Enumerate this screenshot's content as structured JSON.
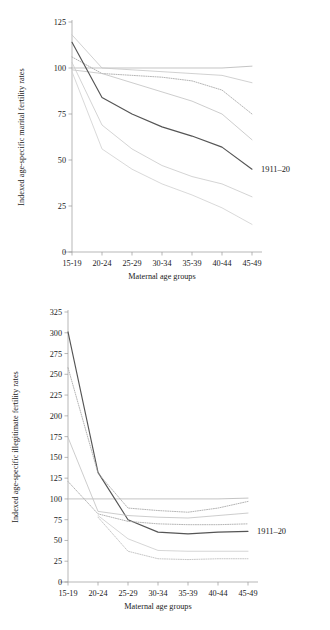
{
  "figure": {
    "charts": [
      {
        "name": "marital-fertility",
        "chart_data": {
          "type": "line",
          "title": "",
          "xlabel": "Maternal age groups",
          "ylabel": "Indexed age-specific marital fertility rates",
          "categories": [
            "15-19",
            "20-24",
            "25-29",
            "30-34",
            "35-39",
            "40-44",
            "45-49"
          ],
          "ylim": [
            0,
            125
          ],
          "yticks": [
            0,
            25,
            50,
            75,
            100,
            125
          ],
          "grid": false,
          "legend_position": "inline-right",
          "annotations": [
            {
              "text": "1911–20",
              "x": "45-49",
              "y": 45
            }
          ],
          "series": [
            {
              "name": "baseline-flat",
              "style": "solid",
              "color": "#b9b9b9",
              "values": [
                100,
                100,
                100,
                100,
                100,
                100,
                101
              ]
            },
            {
              "name": "cohort-a",
              "style": "solid",
              "color": "#c9c9c9",
              "values": [
                118,
                100,
                99,
                98,
                97,
                96,
                92
              ]
            },
            {
              "name": "cohort-b",
              "style": "dotted",
              "color": "#a8a8a8",
              "values": [
                106,
                97,
                96,
                95,
                93,
                88,
                75
              ]
            },
            {
              "name": "cohort-c",
              "style": "solid",
              "color": "#c4c4c4",
              "values": [
                99,
                97,
                92,
                87,
                82,
                75,
                61
              ]
            },
            {
              "name": "cohort-1911-20",
              "style": "solid",
              "color": "#555555",
              "values": [
                114,
                84,
                75,
                68,
                63,
                57,
                45
              ]
            },
            {
              "name": "cohort-d",
              "style": "solid",
              "color": "#cccccc",
              "values": [
                103,
                69,
                56,
                47,
                41,
                37,
                30
              ]
            },
            {
              "name": "cohort-e",
              "style": "solid",
              "color": "#d2d2d2",
              "values": [
                98,
                56,
                45,
                37,
                31,
                24,
                15
              ]
            }
          ]
        }
      },
      {
        "name": "illegitimate-fertility",
        "chart_data": {
          "type": "line",
          "title": "",
          "xlabel": "Maternal age groups",
          "ylabel": "Indexed age-specific illegitimate fertility rates",
          "categories": [
            "15-19",
            "20-24",
            "25-29",
            "30-34",
            "35-39",
            "40-44",
            "45-49"
          ],
          "ylim": [
            0,
            325
          ],
          "yticks": [
            0,
            25,
            50,
            75,
            100,
            125,
            150,
            175,
            200,
            225,
            250,
            275,
            300,
            325
          ],
          "grid": false,
          "legend_position": "inline-right",
          "annotations": [
            {
              "text": "1911–20",
              "x": "45-49",
              "y": 61
            }
          ],
          "series": [
            {
              "name": "baseline-flat",
              "style": "solid",
              "color": "#b9b9b9",
              "values": [
                100,
                100,
                100,
                100,
                100,
                100,
                101
              ]
            },
            {
              "name": "cohort-1911-20",
              "style": "solid",
              "color": "#555555",
              "values": [
                301,
                132,
                75,
                60,
                58,
                60,
                61
              ]
            },
            {
              "name": "cohort-a",
              "style": "dotted",
              "color": "#a8a8a8",
              "values": [
                258,
                131,
                89,
                86,
                84,
                89,
                97
              ]
            },
            {
              "name": "cohort-b",
              "style": "solid",
              "color": "#c4c4c4",
              "values": [
                174,
                85,
                80,
                78,
                77,
                80,
                83
              ]
            },
            {
              "name": "cohort-c",
              "style": "dotted",
              "color": "#a8a8a8",
              "values": [
                121,
                82,
                73,
                70,
                69,
                69,
                70
              ]
            },
            {
              "name": "cohort-d",
              "style": "solid",
              "color": "#cfcfcf",
              "values": [
                null,
                80,
                52,
                38,
                37,
                37,
                37
              ]
            },
            {
              "name": "cohort-e",
              "style": "dotted",
              "color": "#bdbdbd",
              "values": [
                null,
                78,
                37,
                28,
                27,
                28,
                28
              ]
            }
          ]
        }
      }
    ]
  },
  "colors": {
    "axis": "#9a9a9a",
    "text": "#1a1a1a",
    "highlight": "#555555"
  }
}
